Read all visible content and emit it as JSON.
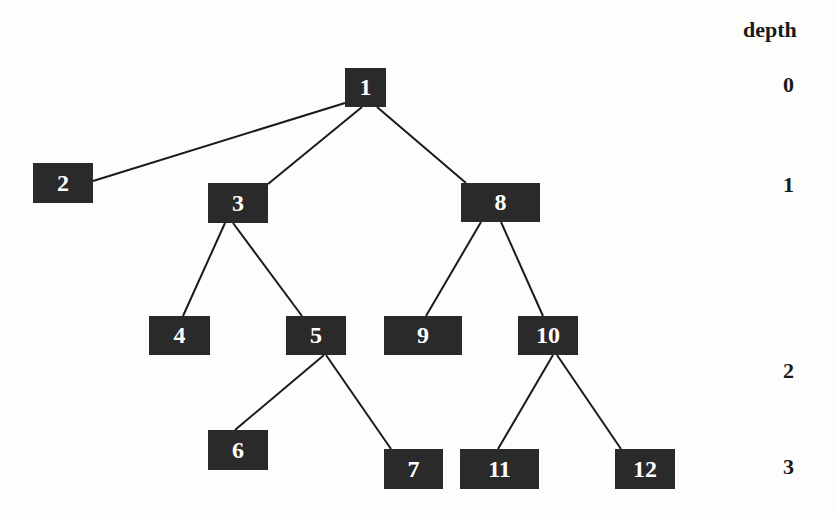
{
  "diagram": {
    "type": "tree",
    "depth_header": "depth",
    "depth_levels": [
      {
        "label": "0",
        "x": 783,
        "y": 72
      },
      {
        "label": "1",
        "x": 783,
        "y": 172
      },
      {
        "label": "2",
        "x": 783,
        "y": 358
      },
      {
        "label": "3",
        "x": 783,
        "y": 454
      }
    ],
    "nodes": [
      {
        "id": "1",
        "label": "1",
        "x": 345,
        "y": 68,
        "w": 41,
        "h": 39
      },
      {
        "id": "2",
        "label": "2",
        "x": 33,
        "y": 163,
        "w": 60,
        "h": 40
      },
      {
        "id": "3",
        "label": "3",
        "x": 208,
        "y": 183,
        "w": 60,
        "h": 40
      },
      {
        "id": "8",
        "label": "8",
        "x": 461,
        "y": 183,
        "w": 79,
        "h": 39
      },
      {
        "id": "4",
        "label": "4",
        "x": 149,
        "y": 316,
        "w": 61,
        "h": 39
      },
      {
        "id": "5",
        "label": "5",
        "x": 286,
        "y": 316,
        "w": 60,
        "h": 39
      },
      {
        "id": "9",
        "label": "9",
        "x": 384,
        "y": 316,
        "w": 78,
        "h": 39
      },
      {
        "id": "10",
        "label": "10",
        "x": 518,
        "y": 316,
        "w": 60,
        "h": 39
      },
      {
        "id": "6",
        "label": "6",
        "x": 208,
        "y": 430,
        "w": 60,
        "h": 40
      },
      {
        "id": "7",
        "label": "7",
        "x": 384,
        "y": 449,
        "w": 59,
        "h": 40
      },
      {
        "id": "11",
        "label": "11",
        "x": 460,
        "y": 449,
        "w": 79,
        "h": 40
      },
      {
        "id": "12",
        "label": "12",
        "x": 615,
        "y": 449,
        "w": 60,
        "h": 40
      }
    ],
    "edges": [
      {
        "from": "1",
        "to": "2",
        "x1": 345,
        "y1": 103,
        "x2": 93,
        "y2": 181
      },
      {
        "from": "1",
        "to": "3",
        "x1": 362,
        "y1": 107,
        "x2": 268,
        "y2": 184
      },
      {
        "from": "1",
        "to": "8",
        "x1": 377,
        "y1": 107,
        "x2": 466,
        "y2": 183
      },
      {
        "from": "3",
        "to": "4",
        "x1": 225,
        "y1": 223,
        "x2": 183,
        "y2": 316
      },
      {
        "from": "3",
        "to": "5",
        "x1": 233,
        "y1": 223,
        "x2": 302,
        "y2": 316
      },
      {
        "from": "8",
        "to": "9",
        "x1": 481,
        "y1": 222,
        "x2": 426,
        "y2": 316
      },
      {
        "from": "8",
        "to": "10",
        "x1": 501,
        "y1": 222,
        "x2": 543,
        "y2": 316
      },
      {
        "from": "5",
        "to": "6",
        "x1": 324,
        "y1": 355,
        "x2": 235,
        "y2": 430
      },
      {
        "from": "5",
        "to": "7",
        "x1": 326,
        "y1": 355,
        "x2": 391,
        "y2": 449
      },
      {
        "from": "10",
        "to": "11",
        "x1": 553,
        "y1": 355,
        "x2": 498,
        "y2": 449
      },
      {
        "from": "10",
        "to": "12",
        "x1": 557,
        "y1": 355,
        "x2": 621,
        "y2": 449
      }
    ],
    "colors": {
      "node_fill": "#2a2a2a",
      "node_text": "#ffffff",
      "edge": "#1a1a1a",
      "background": "#fdfdfc"
    }
  }
}
